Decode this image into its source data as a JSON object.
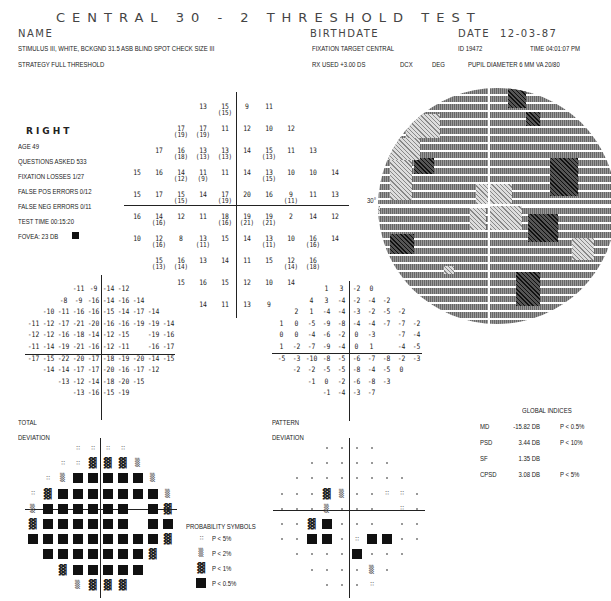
{
  "header": {
    "title": "CENTRAL 30 - 2 THRESHOLD TEST",
    "name_label": "NAME",
    "birthdate_label": "BIRTHDATE",
    "date_label": "DATE",
    "date_value": "12-03-87",
    "stimulus": "STIMULUS   III, WHITE, BCKGND 31.5 ASB   BLIND SPOT CHECK SIZE  III",
    "strategy": "STRATEGY   FULL THRESHOLD",
    "fixation_target": "FIXATION TARGET    CENTRAL",
    "id": "ID  19472",
    "time": "TIME  04:01:07 PM",
    "rx_used": "RX USED +3.00 DS",
    "dcx": "DCX",
    "deg": "DEG",
    "pupil": "PUPIL DIAMETER  6 MM   VA  20/80"
  },
  "patient": {
    "eye": "RIGHT",
    "age": "AGE        49",
    "questions": "QUESTIONS ASKED   533",
    "fixation_losses": "FIXATION LOSSES   1/27",
    "false_pos": "FALSE POS ERRORS  0/12",
    "false_neg": "FALSE NEG ERRORS  0/11",
    "test_time": "TEST TIME 00:15:20",
    "fovea": "FOVEA:  23 DB"
  },
  "threshold": {
    "rows": [
      [
        [
          "13",
          ""
        ],
        [
          "15",
          "(15)"
        ],
        [
          "9",
          ""
        ],
        [
          "11",
          ""
        ]
      ],
      [
        [
          "17",
          "(19)"
        ],
        [
          "17",
          "(19)"
        ],
        [
          "11",
          ""
        ],
        [
          "12",
          ""
        ],
        [
          "10",
          ""
        ],
        [
          "12",
          ""
        ]
      ],
      [
        [
          "17",
          ""
        ],
        [
          "16",
          "(18)"
        ],
        [
          "13",
          "(13)"
        ],
        [
          "13",
          "(13)"
        ],
        [
          "14",
          ""
        ],
        [
          "15",
          "(13)"
        ],
        [
          "11",
          ""
        ],
        [
          "13",
          ""
        ]
      ],
      [
        [
          "15",
          ""
        ],
        [
          "16",
          ""
        ],
        [
          "14",
          "(12)"
        ],
        [
          "11",
          "(9)"
        ],
        [
          "11",
          ""
        ],
        [
          "14",
          ""
        ],
        [
          "13",
          "(15)"
        ],
        [
          "10",
          ""
        ],
        [
          "10",
          ""
        ],
        [
          "14",
          ""
        ]
      ],
      [
        [
          "15",
          ""
        ],
        [
          "17",
          ""
        ],
        [
          "15",
          "(15)"
        ],
        [
          "14",
          ""
        ],
        [
          "17",
          "(19)"
        ],
        [
          "20",
          ""
        ],
        [
          "16",
          ""
        ],
        [
          "9",
          "(11)"
        ],
        [
          "11",
          ""
        ],
        [
          "13",
          ""
        ]
      ],
      [
        [
          "16",
          ""
        ],
        [
          "14",
          "(16)"
        ],
        [
          "12",
          ""
        ],
        [
          "11",
          ""
        ],
        [
          "18",
          "(16)"
        ],
        [
          "19",
          "(21)"
        ],
        [
          "19",
          "(21)"
        ],
        [
          "2",
          ""
        ],
        [
          "14",
          ""
        ],
        [
          "12",
          ""
        ]
      ],
      [
        [
          "10",
          ""
        ],
        [
          "12",
          "(16)"
        ],
        [
          "8",
          ""
        ],
        [
          "13",
          "(11)"
        ],
        [
          "15",
          ""
        ],
        [
          "14",
          ""
        ],
        [
          "13",
          "(11)"
        ],
        [
          "10",
          ""
        ],
        [
          "16",
          "(16)"
        ],
        [
          "14",
          ""
        ]
      ],
      [
        [
          "15",
          "(13)"
        ],
        [
          "16",
          "(14)"
        ],
        [
          "13",
          ""
        ],
        [
          "14",
          ""
        ],
        [
          "11",
          ""
        ],
        [
          "15",
          ""
        ],
        [
          "12",
          "(14)"
        ],
        [
          "16",
          "(18)"
        ]
      ],
      [
        [
          "15",
          ""
        ],
        [
          "16",
          ""
        ],
        [
          "15",
          ""
        ],
        [
          "12",
          ""
        ],
        [
          "10",
          ""
        ],
        [
          "14",
          ""
        ]
      ],
      [
        [
          "14",
          ""
        ],
        [
          "11",
          ""
        ],
        [
          "13",
          ""
        ],
        [
          "9",
          ""
        ]
      ]
    ]
  },
  "total_deviation": {
    "label_1": "TOTAL",
    "label_2": "DEVIATION",
    "rows": [
      [
        "-11",
        "-9",
        "-14",
        "-12"
      ],
      [
        "-8",
        "-9",
        "-16",
        "-14",
        "-16",
        "-14"
      ],
      [
        "-10",
        "-11",
        "-16",
        "-16",
        "-15",
        "-14",
        "-17",
        "-14"
      ],
      [
        "-11",
        "-12",
        "-17",
        "-21",
        "-20",
        "-16",
        "-16",
        "-19",
        "-19",
        "-14"
      ],
      [
        "-12",
        "-12",
        "-16",
        "-18",
        "-14",
        "-12",
        "-15",
        "",
        "-19",
        "-16"
      ],
      [
        "-11",
        "-14",
        "-19",
        "-21",
        "-16",
        "-12",
        "-11",
        "",
        "-16",
        "-17"
      ],
      [
        "-17",
        "-15",
        "-22",
        "-20",
        "-17",
        "-18",
        "-19",
        "-20",
        "-14",
        "-15"
      ],
      [
        "-14",
        "-14",
        "-17",
        "-17",
        "-20",
        "-16",
        "-17",
        "-12"
      ],
      [
        "-13",
        "-12",
        "-14",
        "-18",
        "-20",
        "-15"
      ],
      [
        "-13",
        "-16",
        "-15",
        "-19"
      ]
    ],
    "prob_rows": [
      [
        "5",
        "5",
        "5",
        "5"
      ],
      [
        "5",
        "5",
        "1",
        "1",
        "1",
        "2"
      ],
      [
        "5",
        "2",
        "0",
        "0",
        "0",
        "0",
        "0",
        "2"
      ],
      [
        "5",
        "1",
        "0",
        "0",
        "0",
        "0",
        "0",
        "0",
        "0",
        "2"
      ],
      [
        "2",
        "0",
        "0",
        "0",
        "0",
        "0",
        "0",
        "",
        "0",
        "1"
      ],
      [
        "1",
        "0",
        "0",
        "0",
        "0",
        "0",
        "0",
        "",
        "0",
        "0"
      ],
      [
        "0",
        "0",
        "0",
        "0",
        "0",
        "0",
        "0",
        "0",
        "0",
        "1"
      ],
      [
        "0",
        "0",
        "0",
        "0",
        "0",
        "0",
        "0",
        "1"
      ],
      [
        "1",
        "0",
        "0",
        "0",
        "0",
        "0"
      ],
      [
        "2",
        "1",
        "1",
        "1"
      ]
    ]
  },
  "pattern_deviation": {
    "label_1": "PATTERN",
    "label_2": "DEVIATION",
    "rows": [
      [
        "1",
        "3",
        "-2",
        "0"
      ],
      [
        "4",
        "3",
        "-4",
        "-2",
        "-4",
        "-2"
      ],
      [
        "2",
        "1",
        "-4",
        "-4",
        "-3",
        "-2",
        "-5",
        "-2"
      ],
      [
        "1",
        "0",
        "-5",
        "-9",
        "-8",
        "-4",
        "-4",
        "-7",
        "-7",
        "-2"
      ],
      [
        "0",
        "0",
        "-4",
        "-6",
        "-2",
        "0",
        "-3",
        "",
        "-7",
        "-4"
      ],
      [
        "1",
        "-2",
        "-7",
        "-9",
        "-4",
        "0",
        "1",
        "",
        "-4",
        "-5"
      ],
      [
        "-5",
        "-3",
        "-10",
        "-8",
        "-5",
        "-6",
        "-7",
        "-8",
        "-2",
        "-3"
      ],
      [
        "-2",
        "-2",
        "-5",
        "-5",
        "-8",
        "-4",
        "-5",
        "0"
      ],
      [
        "-1",
        "0",
        "-2",
        "-6",
        "-8",
        "-3"
      ],
      [
        "-1",
        "-4",
        "-3",
        "-7"
      ]
    ],
    "prob_rows": [
      [
        "n",
        "n",
        "n",
        "n"
      ],
      [
        "n",
        "n",
        "n",
        "n",
        "n",
        "n"
      ],
      [
        "n",
        "n",
        "n",
        "n",
        "n",
        "n",
        "n",
        "n"
      ],
      [
        "n",
        "n",
        "n",
        "1",
        "2",
        "n",
        "n",
        "5",
        "5",
        "n"
      ],
      [
        "n",
        "n",
        "n",
        "2",
        "n",
        "n",
        "n",
        "",
        "5",
        "n"
      ],
      [
        "n",
        "n",
        "1",
        "0",
        "n",
        "n",
        "n",
        "",
        "n",
        "n"
      ],
      [
        "n",
        "n",
        "0",
        "0",
        "n",
        "5",
        "0",
        "0",
        "n",
        "n"
      ],
      [
        "n",
        "n",
        "n",
        "n",
        "0",
        "n",
        "n",
        "n"
      ],
      [
        "n",
        "n",
        "n",
        "n",
        "2",
        "n"
      ],
      [
        "n",
        "n",
        "n",
        "5"
      ]
    ]
  },
  "greyscale": {
    "axis_label": "30°"
  },
  "global_indices": {
    "title": "GLOBAL INDICES",
    "rows": [
      {
        "name": "MD",
        "value": "-15.82 DB",
        "p": "P < 0.5%"
      },
      {
        "name": "PSD",
        "value": "3.44 DB",
        "p": "P <  10%"
      },
      {
        "name": "SF",
        "value": "1.35 DB",
        "p": ""
      },
      {
        "name": "CPSD",
        "value": "3.08 DB",
        "p": "P <   5%"
      }
    ]
  },
  "probability_symbols": {
    "title": "PROBABILITY SYMBOLS",
    "items": [
      {
        "sym": "5",
        "label": "P <   5%"
      },
      {
        "sym": "2",
        "label": "P <   2%"
      },
      {
        "sym": "1",
        "label": "P <   1%"
      },
      {
        "sym": "0",
        "label": "P < 0.5%"
      }
    ]
  }
}
